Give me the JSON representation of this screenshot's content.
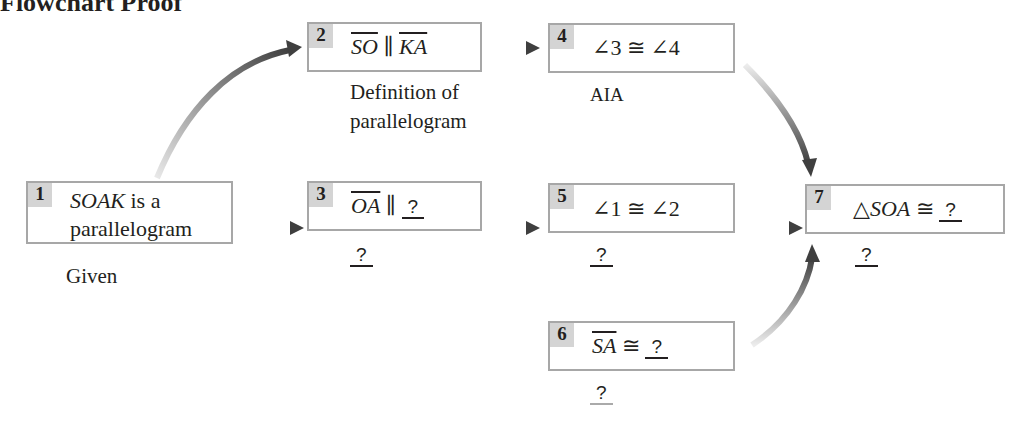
{
  "title": "Flowchart Proof",
  "colors": {
    "box_border": "#a7a7a7",
    "number_bg": "#d4d4d4",
    "arrow": "#4a4a4a",
    "text": "#231f20"
  },
  "nodes": [
    {
      "id": 1,
      "number": "1",
      "statement_var": "SOAK",
      "statement_rest": " is a",
      "statement_line2": "parallelogram",
      "reason": "Given"
    },
    {
      "id": 2,
      "number": "2",
      "seg1": "SO",
      "relation": " ∥ ",
      "seg2": "KA",
      "reason_line1": "Definition of",
      "reason_line2": "parallelogram"
    },
    {
      "id": 3,
      "number": "3",
      "seg1": "OA",
      "relation": " ∥ ",
      "blank": "?",
      "reason": "?"
    },
    {
      "id": 4,
      "number": "4",
      "statement": "∠3 ≅ ∠4",
      "reason": "AIA"
    },
    {
      "id": 5,
      "number": "5",
      "statement": "∠1 ≅ ∠2",
      "reason": "?"
    },
    {
      "id": 6,
      "number": "6",
      "seg1": "SA",
      "relation": " ≅ ",
      "blank": "?",
      "reason": "?"
    },
    {
      "id": 7,
      "number": "7",
      "prefix": "△",
      "var": "SOA",
      "relation": " ≅ ",
      "blank": "?",
      "reason": "?"
    }
  ],
  "edges": [
    {
      "from": 1,
      "to": 2,
      "style": "curved"
    },
    {
      "from": 1,
      "to": 3,
      "style": "straight"
    },
    {
      "from": 2,
      "to": 4,
      "style": "straight"
    },
    {
      "from": 3,
      "to": 5,
      "style": "straight"
    },
    {
      "from": 4,
      "to": 7,
      "style": "curved"
    },
    {
      "from": 5,
      "to": 7,
      "style": "straight"
    },
    {
      "from": 6,
      "to": 7,
      "style": "curved"
    }
  ]
}
